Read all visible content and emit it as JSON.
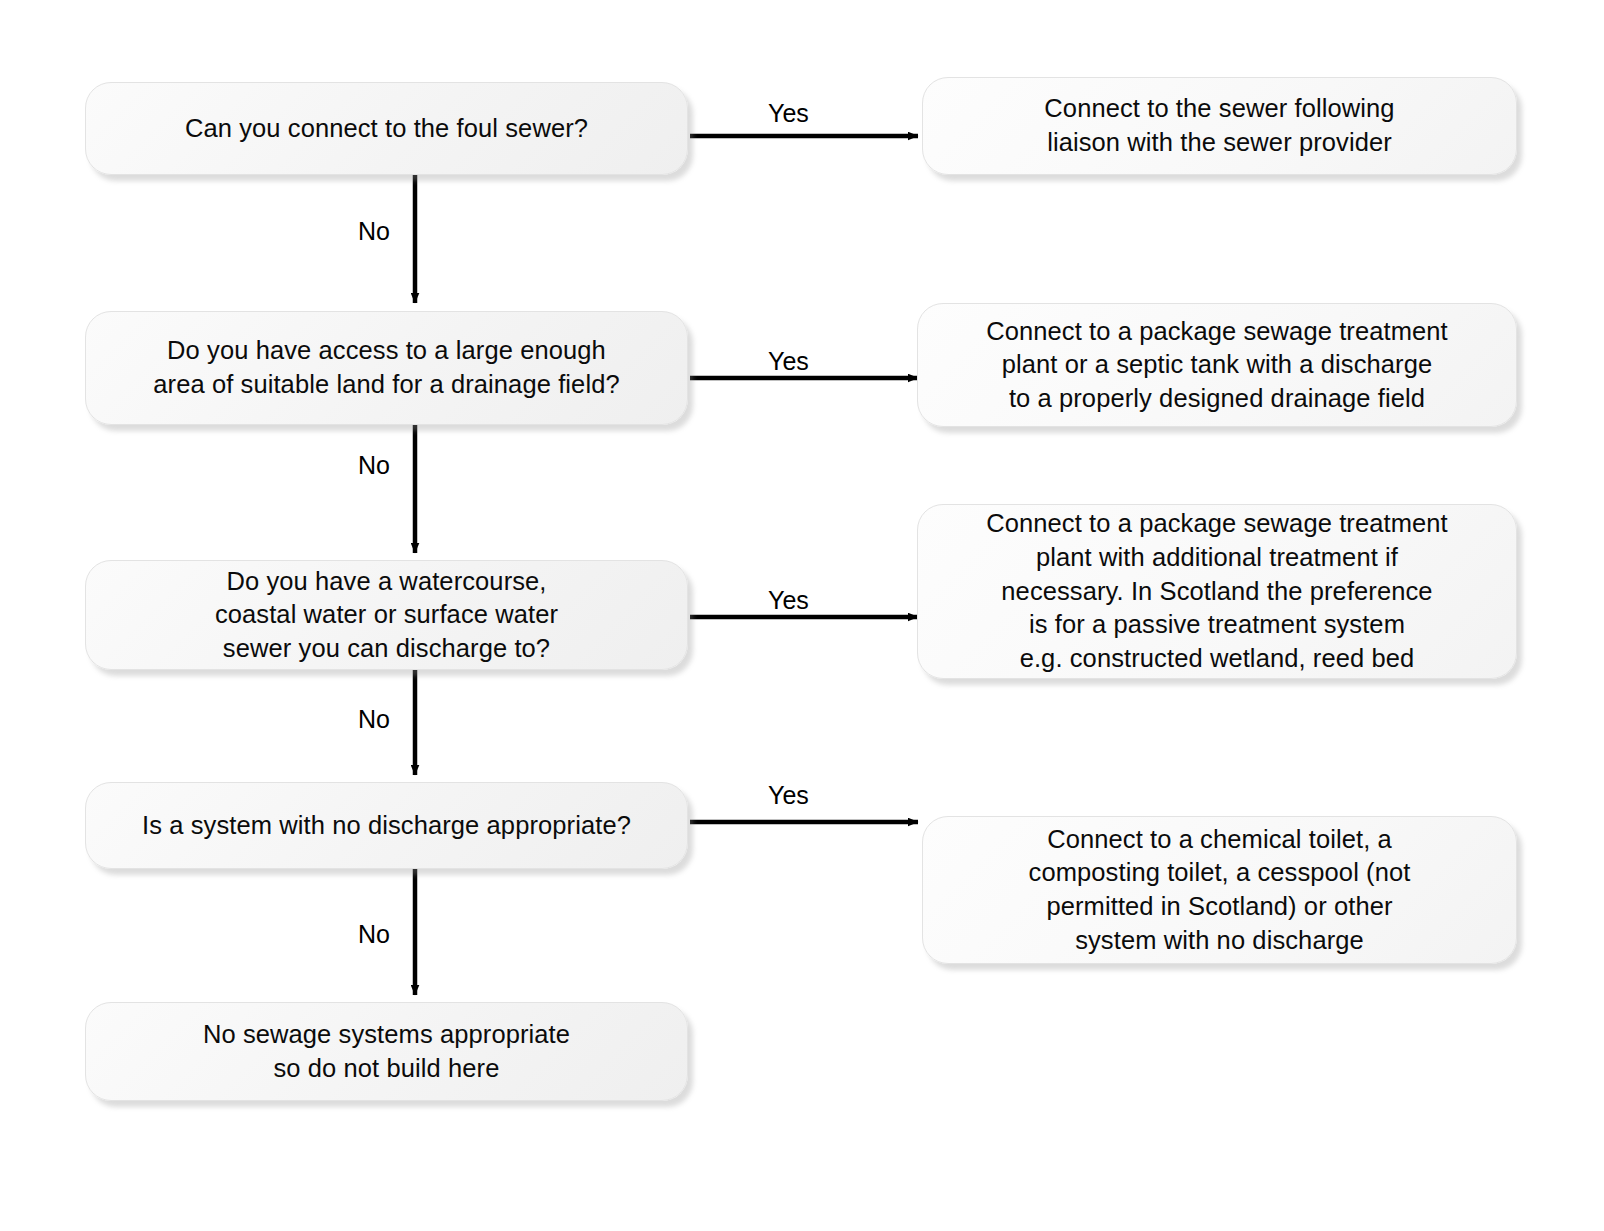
{
  "diagram": {
    "background_color": "#ffffff",
    "box_fill_color": "#f5f5f5",
    "box_border_color": "#e3e3e3",
    "connector_color": "#000000",
    "text_color": "#0b0b0b"
  },
  "questions": [
    {
      "id": "q1",
      "text": "Can you connect to the foul sewer?",
      "yes_label": "Yes",
      "no_label": "No"
    },
    {
      "id": "q2",
      "text": "Do you have access to a large enough\narea of suitable land for a drainage field?",
      "yes_label": "Yes",
      "no_label": "No"
    },
    {
      "id": "q3",
      "text": "Do you have a watercourse,\ncoastal water or surface water\nsewer you can discharge to?",
      "yes_label": "Yes",
      "no_label": "No"
    },
    {
      "id": "q4",
      "text": "Is a system with no discharge appropriate?",
      "yes_label": "Yes",
      "no_label": "No"
    }
  ],
  "outcomes": [
    {
      "id": "o1",
      "text": "Connect to the sewer following\nliaison with the sewer provider"
    },
    {
      "id": "o2",
      "text": "Connect to a package sewage treatment\nplant or a septic tank with a discharge\nto a properly designed drainage field"
    },
    {
      "id": "o3",
      "text": "Connect to a package sewage treatment\nplant with additional treatment if\nnecessary. In Scotland the preference\nis for a passive treatment system\ne.g. constructed wetland, reed bed"
    },
    {
      "id": "o4",
      "text": "Connect to a chemical toilet, a\ncomposting toilet, a cesspool (not\npermitted in Scotland) or other\nsystem with no discharge"
    }
  ],
  "terminal": {
    "id": "t1",
    "text": "No sewage systems appropriate\nso do not build here"
  }
}
